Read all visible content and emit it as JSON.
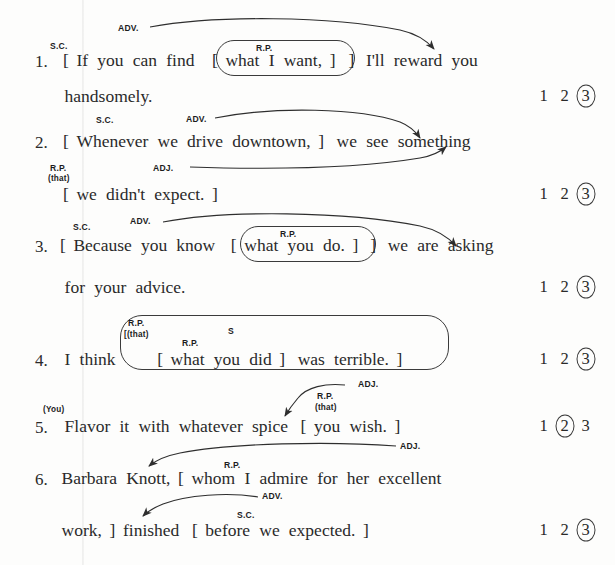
{
  "worksheet": {
    "rating_options": [
      "1",
      "2",
      "3"
    ],
    "items": [
      {
        "number": "1.",
        "lines": [
          [
            "[",
            "If",
            "you",
            "can",
            "find",
            "[",
            "what",
            "I",
            "want,",
            "]",
            "]",
            "I'll",
            "reward",
            "you"
          ],
          [
            "handsomely."
          ]
        ],
        "tags": [
          {
            "text": "S.C."
          },
          {
            "text": "ADV."
          },
          {
            "text": "R.P."
          }
        ],
        "rating_selected": "3"
      },
      {
        "number": "2.",
        "lines": [
          [
            "[",
            "Whenever",
            "we",
            "drive",
            "downtown,",
            "]",
            "we",
            "see",
            "something"
          ],
          [
            "[",
            "we",
            "didn't",
            "expect.",
            "]"
          ]
        ],
        "tags": [
          {
            "text": "S.C."
          },
          {
            "text": "ADV."
          },
          {
            "text": "R.P."
          },
          {
            "text": "(that)"
          },
          {
            "text": "ADJ."
          }
        ],
        "rating_selected": "3"
      },
      {
        "number": "3.",
        "lines": [
          [
            "[",
            "Because",
            "you",
            "know",
            "[",
            "what",
            "you",
            "do.",
            "]",
            "]",
            "we",
            "are",
            "asking"
          ],
          [
            "for",
            "your",
            "advice."
          ]
        ],
        "tags": [
          {
            "text": "S.C."
          },
          {
            "text": "ADV."
          },
          {
            "text": "R.P."
          }
        ],
        "rating_selected": "3"
      },
      {
        "number": "4.",
        "lines": [
          [
            "I",
            "think",
            "[",
            "what",
            "you",
            "did",
            "]",
            "was",
            "terrible.",
            "]"
          ]
        ],
        "tags": [
          {
            "text": "R.P."
          },
          {
            "text": "[(that)"
          },
          {
            "text": "R.P."
          },
          {
            "text": "S"
          }
        ],
        "rating_selected": "3"
      },
      {
        "number": "5.",
        "lines": [
          [
            "Flavor",
            "it",
            "with",
            "whatever",
            "spice",
            "[",
            "you",
            "wish.",
            "]"
          ]
        ],
        "tags": [
          {
            "text": "(You)"
          },
          {
            "text": "ADJ."
          },
          {
            "text": "R.P."
          },
          {
            "text": "(that)"
          }
        ],
        "rating_selected": "2"
      },
      {
        "number": "6.",
        "lines": [
          [
            "Barbara",
            "Knott,",
            "[",
            "whom",
            "I",
            "admire",
            "for",
            "her",
            "excellent"
          ],
          [
            "work,",
            "]",
            "finished",
            "[",
            "before",
            "we",
            "expected.",
            "]"
          ]
        ],
        "tags": [
          {
            "text": "ADJ."
          },
          {
            "text": "R.P."
          },
          {
            "text": "ADV."
          },
          {
            "text": "S.C."
          }
        ],
        "rating_selected": "3"
      }
    ]
  },
  "colors": {
    "ink": "#2a2a2a",
    "annotation": "#1c1c1c",
    "rule": "#3b3b3b",
    "page": "#fdfdfc"
  }
}
